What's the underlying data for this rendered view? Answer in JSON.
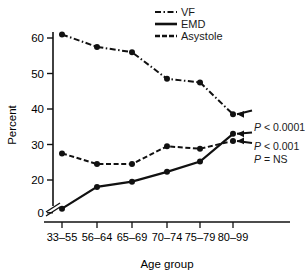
{
  "chart_data": {
    "type": "line",
    "title": "",
    "xlabel": "Age group",
    "ylabel": "Percent",
    "categories": [
      "33–55",
      "56–64",
      "65–69",
      "70–74",
      "75–79",
      "80–99"
    ],
    "yticks": [
      0,
      20,
      30,
      40,
      50,
      60
    ],
    "ylim": [
      0,
      65
    ],
    "axis_break": true,
    "axis_break_note": "y-axis broken between 0 and 20",
    "grid": false,
    "legend_position": "top-right",
    "series": [
      {
        "name": "VF",
        "style": "dash-dot",
        "marker": "filled-circle",
        "values": [
          61.0,
          57.5,
          56.0,
          48.5,
          47.5,
          38.5
        ],
        "annotation": "P < 0.0001"
      },
      {
        "name": "EMD",
        "style": "solid",
        "marker": "filled-circle",
        "values": [
          2.5,
          15.8,
          19.0,
          22.3,
          25.2,
          33.0
        ],
        "annotation": "P < 0.001"
      },
      {
        "name": "Asystole",
        "style": "dashed",
        "marker": "filled-circle",
        "values": [
          27.5,
          24.5,
          24.5,
          29.5,
          28.8,
          31.0
        ],
        "annotation": "P = NS"
      }
    ],
    "annotations": [
      {
        "text": "P < 0.0001",
        "p_italic": "P",
        "rest": " < 0.0001",
        "series": "VF"
      },
      {
        "text": "P < 0.001",
        "p_italic": "P",
        "rest": " < 0.001",
        "series": "EMD"
      },
      {
        "text": "P = NS",
        "p_italic": "P",
        "rest": " = NS",
        "series": "Asystole"
      }
    ]
  },
  "legend": {
    "items": [
      {
        "label": "VF"
      },
      {
        "label": "EMD"
      },
      {
        "label": "Asystole"
      }
    ]
  },
  "axes": {
    "y_title": "Percent",
    "x_title": "Age group",
    "y_tick_labels": [
      "60",
      "50",
      "40",
      "30",
      "20",
      "0"
    ],
    "x_tick_labels": [
      "33–55",
      "56–64",
      "65–69",
      "70–74",
      "75–79",
      "80–99"
    ]
  },
  "caption": {
    "text": ""
  },
  "colors": {
    "ink": "#111111",
    "background": "#ffffff"
  }
}
